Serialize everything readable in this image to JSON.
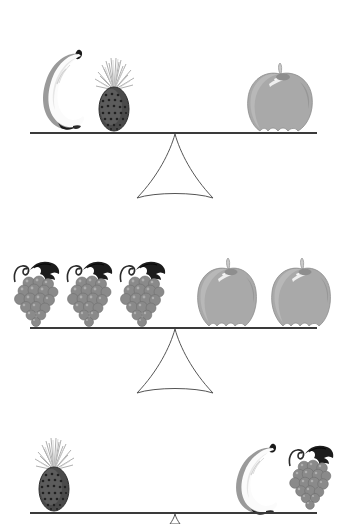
{
  "puzzle": {
    "title": "Fruit balance scales puzzle",
    "description": "Three balance scales comparing fruit weights",
    "canvas": {
      "width": 350,
      "height": 524
    },
    "colors": {
      "background": "#ffffff",
      "beam": "#3a3a3a",
      "fulcrum_stroke": "#555555",
      "apple_body": "#a9a9a9",
      "apple_shadow": "#8e8e8e",
      "apple_highlight": "#f0f0f0",
      "apple_stem": "#c9c9c9",
      "grape_berry": "#8a8a8a",
      "grape_berry_dark": "#6e6e6e",
      "grape_leaf": "#1c1c1c",
      "grape_stem": "#2b2b2b",
      "banana_body": "#fbfbfb",
      "banana_shade": "#9a9a9a",
      "banana_tip": "#1a1a1a",
      "pineapple_body": "#4a4a4a",
      "pineapple_body_light": "#6a6a6a",
      "pineapple_crown": "#b8b8b8"
    },
    "balances": [
      {
        "id": "balance-1",
        "index": 1,
        "beam": {
          "y": 133,
          "x_start": 30,
          "x_end": 317
        },
        "fulcrum": {
          "apex_x": 175,
          "apex_y": 134,
          "base_y": 198,
          "base_half_width": 38
        },
        "state": "level",
        "left_pan": {
          "side": "left",
          "items": [
            {
              "fruit": "banana",
              "count": 1,
              "x": 40,
              "y": 45,
              "w": 48,
              "h": 88
            },
            {
              "fruit": "pineapple",
              "count": 1,
              "x": 92,
              "y": 57,
              "w": 45,
              "h": 76
            }
          ],
          "summary": "1 banana + 1 pineapple"
        },
        "right_pan": {
          "side": "right",
          "items": [
            {
              "fruit": "apple",
              "count": 1,
              "x": 245,
              "y": 62,
              "w": 70,
              "h": 71
            }
          ],
          "summary": "1 apple"
        },
        "equation": "banana + pineapple = apple"
      },
      {
        "id": "balance-2",
        "index": 2,
        "beam": {
          "y": 328,
          "x_start": 30,
          "x_end": 317
        },
        "fulcrum": {
          "apex_x": 175,
          "apex_y": 329,
          "base_y": 393,
          "base_half_width": 38
        },
        "state": "level",
        "left_pan": {
          "side": "left",
          "items": [
            {
              "fruit": "grapes",
              "count": 1,
              "x": 12,
              "y": 258,
              "w": 50,
              "h": 70
            },
            {
              "fruit": "grapes",
              "count": 1,
              "x": 65,
              "y": 258,
              "w": 50,
              "h": 70
            },
            {
              "fruit": "grapes",
              "count": 1,
              "x": 118,
              "y": 258,
              "w": 50,
              "h": 70
            }
          ],
          "summary": "3 bunches of grapes"
        },
        "right_pan": {
          "side": "right",
          "items": [
            {
              "fruit": "apple",
              "count": 1,
              "x": 196,
              "y": 258,
              "w": 63,
              "h": 70
            },
            {
              "fruit": "apple",
              "count": 1,
              "x": 270,
              "y": 258,
              "w": 63,
              "h": 70
            }
          ],
          "summary": "2 apples"
        },
        "equation": "3 grapes = 2 apples"
      },
      {
        "id": "balance-3",
        "index": 3,
        "beam": {
          "y": 513,
          "x_start": 30,
          "x_end": 317
        },
        "fulcrum": null,
        "state": "level",
        "left_pan": {
          "side": "left",
          "items": [
            {
              "fruit": "pineapple",
              "count": 1,
              "x": 32,
              "y": 437,
              "w": 45,
              "h": 76
            }
          ],
          "summary": "1 pineapple"
        },
        "right_pan": {
          "side": "right",
          "items": [
            {
              "fruit": "banana",
              "count": 1,
              "x": 233,
              "y": 440,
              "w": 50,
              "h": 73
            },
            {
              "fruit": "grapes",
              "count": 1,
              "x": 287,
              "y": 443,
              "w": 48,
              "h": 68
            }
          ],
          "summary": "1 banana + 1 bunch of grapes"
        },
        "equation": "pineapple = banana + grapes"
      }
    ],
    "fruit_names": {
      "banana": "banana",
      "pineapple": "pineapple",
      "apple": "apple",
      "grapes": "grapes"
    }
  }
}
